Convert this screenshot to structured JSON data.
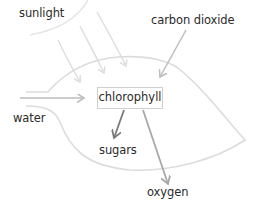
{
  "diagram": {
    "type": "photosynthesis-flow",
    "nodes": {
      "sunlight": "sunlight",
      "carbon_dioxide": "carbon dioxide",
      "water": "water",
      "chlorophyll": "chlorophyll",
      "sugars": "sugars",
      "oxygen": "oxygen"
    },
    "edges": [
      {
        "from": "sunlight",
        "to": "chlorophyll"
      },
      {
        "from": "carbon_dioxide",
        "to": "chlorophyll"
      },
      {
        "from": "water",
        "to": "chlorophyll"
      },
      {
        "from": "chlorophyll",
        "to": "sugars"
      },
      {
        "from": "chlorophyll",
        "to": "oxygen"
      }
    ],
    "colors": {
      "text": "#2a2a2a",
      "leaf_outline": "#dcdcdc",
      "sun_outline": "#e4e4e4",
      "sunlight_arrows": "#dedede",
      "input_arrows": "#bdbdbd",
      "sugars_arrow": "#7a7a7a",
      "oxygen_arrow": "#a8a8a8",
      "box_border": "#cfcfcf"
    }
  }
}
